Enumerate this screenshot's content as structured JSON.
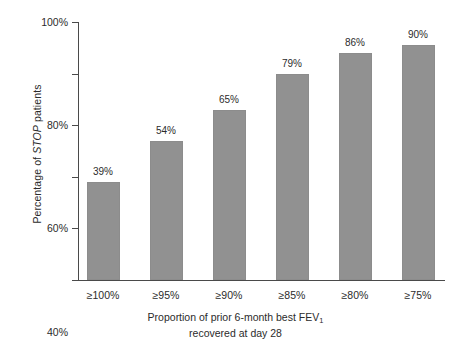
{
  "chart_data": {
    "type": "bar",
    "title": "",
    "categories": [
      "≥100%",
      "≥95%",
      "≥90%",
      "≥85%",
      "≥80%",
      "≥75%"
    ],
    "values": [
      39,
      54,
      65,
      79,
      86,
      90
    ],
    "value_labels": [
      "39%",
      "54%",
      "65%",
      "79%",
      "86%",
      "90%"
    ],
    "bar_pixel_values": [
      38,
      54,
      66,
      80,
      88,
      91
    ],
    "xlabel_line1": "Proportion of prior 6-month best FEV",
    "xlabel_sub": "1",
    "xlabel_line2": "recovered at day 28",
    "ylabel_prefix": "Percentage of ",
    "ylabel_italic": "STOP",
    "ylabel_suffix": " patients",
    "ylim": [
      0,
      100
    ],
    "yticks": [
      0,
      20,
      40,
      60,
      80,
      100
    ],
    "ytick_labels": [
      "0%",
      "20%",
      "40%",
      "60%",
      "80%",
      "100%"
    ],
    "grid": false,
    "legend": "none",
    "bar_color": "#919191",
    "axis_color": "#4a4a4a",
    "background": "#ffffff"
  }
}
